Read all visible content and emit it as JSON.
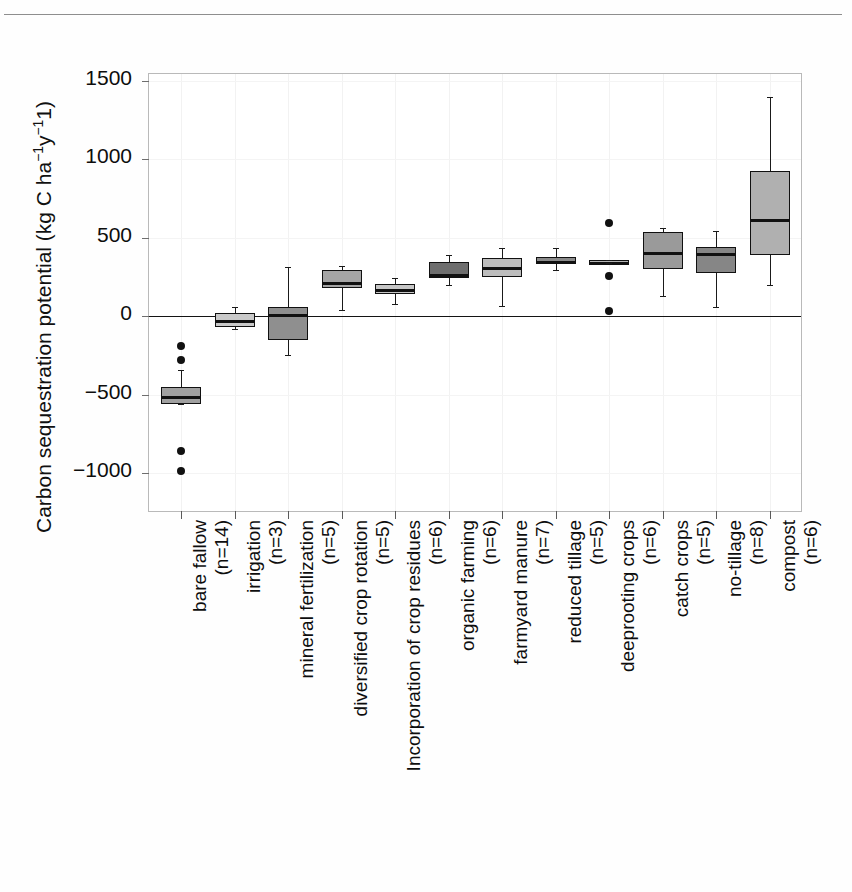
{
  "header": {
    "clipped_text": ""
  },
  "chart_data": {
    "type": "box",
    "title": "",
    "xlabel": "",
    "ylabel": "Carbon sequestration potential (kg C ha",
    "ylabel_sup1": "−1",
    "ylabel_mid": "y",
    "ylabel_sup2": "−1",
    "ylabel_tail": "1)",
    "ylim": [
      -1250,
      1500
    ],
    "yticks": [
      1500,
      1000,
      500,
      0,
      -500,
      -1000
    ],
    "ytick_labels": [
      "1500",
      "1000",
      "500",
      "0",
      "−500",
      "−1000"
    ],
    "grid": "light-vertical-and-horizontal",
    "zero_reference_line": true,
    "legend": "none",
    "categories": [
      "bare fallow",
      "irrigation",
      "mineral fertilization",
      "diversified crop rotation",
      "Incorporation of crop residues",
      "organic farming",
      "farmyard manure",
      "reduced tillage",
      "deeprooting crops",
      "catch crops",
      "no-tillage",
      "compost"
    ],
    "category_counts": [
      "(n=14)",
      "(n=3)",
      "(n=5)",
      "(n=5)",
      "(n=6)",
      "(n=6)",
      "(n=7)",
      "(n=5)",
      "(n=6)",
      "(n=5)",
      "(n=8)",
      "(n=6)"
    ],
    "boxes": [
      {
        "category": "bare fallow",
        "n": 14,
        "whisker_low": -560,
        "q1": -560,
        "median": -510,
        "q3": -455,
        "whisker_high": -345,
        "fill": "#a0a0a0",
        "outliers": [
          -190,
          -280,
          -860,
          -990
        ]
      },
      {
        "category": "irrigation",
        "n": 3,
        "whisker_low": -85,
        "q1": -70,
        "median": -25,
        "q3": 20,
        "whisker_high": 55,
        "fill": "#c9c9c9",
        "outliers": []
      },
      {
        "category": "mineral fertilization",
        "n": 5,
        "whisker_low": -250,
        "q1": -150,
        "median": 10,
        "q3": 55,
        "whisker_high": 310,
        "fill": "#8f8f8f",
        "outliers": []
      },
      {
        "category": "diversified crop rotation",
        "n": 5,
        "whisker_low": 40,
        "q1": 180,
        "median": 215,
        "q3": 295,
        "whisker_high": 320,
        "fill": "#a5a5a5",
        "outliers": []
      },
      {
        "category": "Incorporation of crop residues",
        "n": 6,
        "whisker_low": 75,
        "q1": 140,
        "median": 170,
        "q3": 205,
        "whisker_high": 240,
        "fill": "#c6c6c6",
        "outliers": []
      },
      {
        "category": "organic farming",
        "n": 6,
        "whisker_low": 200,
        "q1": 245,
        "median": 265,
        "q3": 345,
        "whisker_high": 390,
        "fill": "#6e6e6e",
        "outliers": []
      },
      {
        "category": "farmyard manure",
        "n": 7,
        "whisker_low": 65,
        "q1": 250,
        "median": 315,
        "q3": 370,
        "whisker_high": 430,
        "fill": "#bdbdbd",
        "outliers": []
      },
      {
        "category": "reduced tillage",
        "n": 5,
        "whisker_low": 295,
        "q1": 330,
        "median": 350,
        "q3": 375,
        "whisker_high": 435,
        "fill": "#8a8a8a",
        "outliers": []
      },
      {
        "category": "deeprooting crops",
        "n": 6,
        "whisker_low": 340,
        "q1": 335,
        "median": 345,
        "q3": 355,
        "whisker_high": 355,
        "fill": "#b4b4b4",
        "outliers": [
          595,
          255,
          35
        ]
      },
      {
        "category": "catch crops",
        "n": 5,
        "whisker_low": 125,
        "q1": 300,
        "median": 410,
        "q3": 535,
        "whisker_high": 560,
        "fill": "#9a9a9a",
        "outliers": []
      },
      {
        "category": "no-tillage",
        "n": 8,
        "whisker_low": 60,
        "q1": 275,
        "median": 400,
        "q3": 440,
        "whisker_high": 540,
        "fill": "#868686",
        "outliers": []
      },
      {
        "category": "compost",
        "n": 6,
        "whisker_low": 195,
        "q1": 390,
        "median": 615,
        "q3": 925,
        "whisker_high": 1395,
        "fill": "#b0b0b0",
        "outliers": []
      }
    ]
  },
  "colors": {
    "axis": "#b9b9b9",
    "ink": "#111111",
    "grid": "#f2f2f2",
    "zero_line": "#141414"
  }
}
